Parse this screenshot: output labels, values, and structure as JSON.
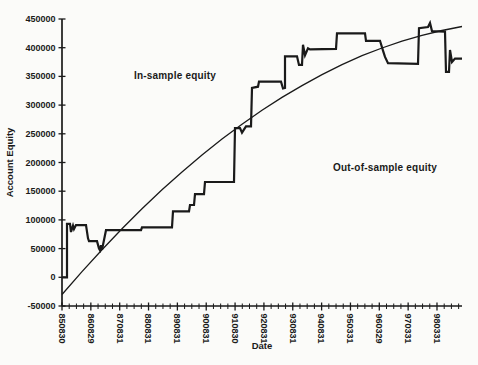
{
  "figure": {
    "background": "#fbfbf9",
    "ink": "#1a1a1a"
  },
  "chart_data": {
    "type": "line",
    "title": "",
    "xlabel": "Date",
    "ylabel": "Account Equity",
    "ylim": [
      -50000,
      450000
    ],
    "y_ticks": [
      450000,
      400000,
      350000,
      300000,
      250000,
      200000,
      150000,
      100000,
      50000,
      0,
      -50000
    ],
    "x_tick_labels": [
      "850830",
      "860829",
      "870831",
      "880831",
      "890831",
      "900831",
      "910830",
      "920831",
      "930831",
      "940831",
      "950331",
      "960329",
      "970331",
      "980331"
    ],
    "minor_ticks_per_major_interval": 3,
    "grid": false,
    "legend_position": "none",
    "annotations": [
      {
        "text": "In-sample equity",
        "x_frac": 0.2825,
        "value": 350000
      },
      {
        "text": "Out-of-sample equity",
        "x_frac": 0.8075,
        "value": 190000
      }
    ],
    "series": [
      {
        "name": "account-equity",
        "style": "thick-stepped",
        "points": [
          [
            0.0,
            0
          ],
          [
            0.0125,
            0
          ],
          [
            0.0125,
            93000
          ],
          [
            0.02,
            93000
          ],
          [
            0.0225,
            79000
          ],
          [
            0.0275,
            90000
          ],
          [
            0.03,
            84000
          ],
          [
            0.035,
            91000
          ],
          [
            0.06,
            91000
          ],
          [
            0.065,
            68000
          ],
          [
            0.0675,
            63000
          ],
          [
            0.0875,
            63000
          ],
          [
            0.0925,
            50000
          ],
          [
            0.095,
            47000
          ],
          [
            0.0975,
            56000
          ],
          [
            0.1,
            48000
          ],
          [
            0.105,
            65000
          ],
          [
            0.11,
            82000
          ],
          [
            0.1975,
            82000
          ],
          [
            0.2,
            87000
          ],
          [
            0.275,
            87000
          ],
          [
            0.2775,
            115000
          ],
          [
            0.3175,
            115000
          ],
          [
            0.32,
            126000
          ],
          [
            0.33,
            126000
          ],
          [
            0.3325,
            145000
          ],
          [
            0.355,
            145000
          ],
          [
            0.3575,
            166000
          ],
          [
            0.43,
            166000
          ],
          [
            0.4325,
            260000
          ],
          [
            0.445,
            260000
          ],
          [
            0.45,
            252000
          ],
          [
            0.46,
            263000
          ],
          [
            0.4725,
            263000
          ],
          [
            0.475,
            330000
          ],
          [
            0.49,
            332000
          ],
          [
            0.4925,
            341000
          ],
          [
            0.5475,
            341000
          ],
          [
            0.5525,
            329000
          ],
          [
            0.5575,
            330000
          ],
          [
            0.5575,
            385000
          ],
          [
            0.5875,
            385000
          ],
          [
            0.5925,
            370000
          ],
          [
            0.6,
            370000
          ],
          [
            0.6025,
            405000
          ],
          [
            0.6075,
            387000
          ],
          [
            0.615,
            399000
          ],
          [
            0.62,
            397000
          ],
          [
            0.685,
            398000
          ],
          [
            0.6875,
            425000
          ],
          [
            0.7575,
            425000
          ],
          [
            0.76,
            412000
          ],
          [
            0.795,
            412000
          ],
          [
            0.8025,
            395000
          ],
          [
            0.8075,
            384000
          ],
          [
            0.815,
            373000
          ],
          [
            0.89,
            372000
          ],
          [
            0.8925,
            434000
          ],
          [
            0.915,
            436000
          ],
          [
            0.92,
            443000
          ],
          [
            0.925,
            429000
          ],
          [
            0.9575,
            428000
          ],
          [
            0.96,
            358000
          ],
          [
            0.9675,
            358000
          ],
          [
            0.97,
            396000
          ],
          [
            0.975,
            375000
          ],
          [
            0.9825,
            381000
          ],
          [
            1.0,
            381000
          ]
        ]
      },
      {
        "name": "fitted-equity-curve",
        "style": "thin-smooth",
        "points": [
          [
            0.0,
            -30000
          ],
          [
            0.05,
            10000
          ],
          [
            0.1,
            48000
          ],
          [
            0.15,
            84500
          ],
          [
            0.2,
            119500
          ],
          [
            0.25,
            152500
          ],
          [
            0.3,
            183500
          ],
          [
            0.35,
            213000
          ],
          [
            0.4,
            241000
          ],
          [
            0.45,
            266500
          ],
          [
            0.5,
            291000
          ],
          [
            0.55,
            313500
          ],
          [
            0.6,
            334000
          ],
          [
            0.65,
            353000
          ],
          [
            0.7,
            370500
          ],
          [
            0.75,
            386000
          ],
          [
            0.8,
            399500
          ],
          [
            0.85,
            411500
          ],
          [
            0.9,
            421500
          ],
          [
            0.95,
            430000
          ],
          [
            1.0,
            437000
          ]
        ]
      }
    ]
  }
}
